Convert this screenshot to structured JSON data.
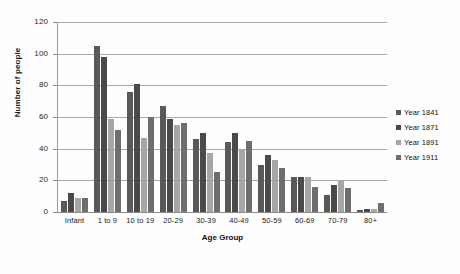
{
  "chart_data": {
    "type": "bar",
    "title": "",
    "xlabel": "Age Group",
    "ylabel": "Number of people",
    "ylim": [
      0,
      120
    ],
    "yticks": [
      0,
      20,
      40,
      60,
      80,
      100,
      120
    ],
    "grid": true,
    "legend_position": "right",
    "categories": [
      "Infant",
      "1 to 9",
      "10 to 19",
      "20-29",
      "30-39",
      "40-49",
      "50-59",
      "60-69",
      "70-79",
      "80+"
    ],
    "series": [
      {
        "name": "Year 1841",
        "color": "#595959",
        "values": [
          7,
          105,
          76,
          67,
          46,
          44,
          30,
          22,
          11,
          1
        ]
      },
      {
        "name": "Year 1871",
        "color": "#4a4a4a",
        "values": [
          12,
          98,
          81,
          59,
          50,
          50,
          36,
          22,
          17,
          2
        ]
      },
      {
        "name": "Year 1891",
        "color": "#a6a6a6",
        "values": [
          9,
          59,
          47,
          55,
          37,
          40,
          33,
          22,
          20,
          2
        ]
      },
      {
        "name": "Year 1911",
        "color": "#6e6e6e",
        "values": [
          9,
          52,
          60,
          56,
          25,
          45,
          28,
          16,
          15,
          6
        ]
      }
    ]
  }
}
